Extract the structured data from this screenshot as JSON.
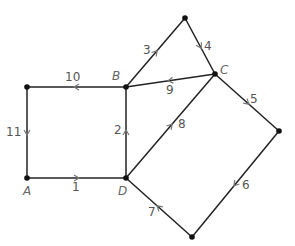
{
  "diagram": {
    "type": "directed-graph",
    "vertices": [
      {
        "id": "A",
        "label": "A",
        "x": 27,
        "y": 178,
        "lx": 23,
        "ly": 195
      },
      {
        "id": "B",
        "label": "B",
        "x": 126,
        "y": 87,
        "lx": 112,
        "ly": 80
      },
      {
        "id": "C",
        "label": "C",
        "x": 215,
        "y": 74,
        "lx": 220,
        "ly": 74
      },
      {
        "id": "D",
        "label": "D",
        "x": 126,
        "y": 178,
        "lx": 118,
        "ly": 195
      },
      {
        "id": "TL",
        "label": "",
        "x": 27,
        "y": 87
      },
      {
        "id": "T",
        "label": "",
        "x": 185,
        "y": 18
      },
      {
        "id": "R",
        "label": "",
        "x": 279,
        "y": 131
      },
      {
        "id": "Bot",
        "label": "",
        "x": 192,
        "y": 237
      }
    ],
    "edges": [
      {
        "label": "1",
        "from": "A",
        "to": "D",
        "lx": 72,
        "ly": 191
      },
      {
        "label": "2",
        "from": "D",
        "to": "B",
        "lx": 114,
        "ly": 134
      },
      {
        "label": "3",
        "from": "B",
        "to": "T",
        "lx": 143,
        "ly": 54
      },
      {
        "label": "4",
        "from": "T",
        "to": "C",
        "lx": 204,
        "ly": 50
      },
      {
        "label": "5",
        "from": "C",
        "to": "R",
        "lx": 250,
        "ly": 103
      },
      {
        "label": "6",
        "from": "R",
        "to": "Bot",
        "lx": 242,
        "ly": 189
      },
      {
        "label": "7",
        "from": "Bot",
        "to": "D",
        "lx": 148,
        "ly": 216
      },
      {
        "label": "8",
        "from": "D",
        "to": "C",
        "lx": 178,
        "ly": 128
      },
      {
        "label": "9",
        "from": "C",
        "to": "B",
        "lx": 166,
        "ly": 94
      },
      {
        "label": "10",
        "from": "B",
        "to": "TL",
        "lx": 65,
        "ly": 81
      },
      {
        "label": "11",
        "from": "TL",
        "to": "A",
        "lx": 6,
        "ly": 136
      }
    ]
  }
}
